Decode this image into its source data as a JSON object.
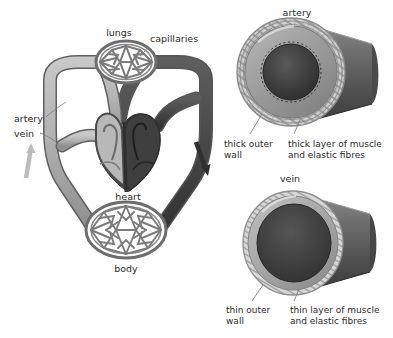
{
  "figure": {
    "background_color": "#ffffff",
    "panels": [
      "circulation-schematic",
      "artery-cross-section",
      "vein-cross-section"
    ]
  },
  "circulation": {
    "labels": {
      "lungs": "lungs",
      "capillaries": "capillaries",
      "artery": "artery",
      "vein": "vein",
      "heart": "heart",
      "body": "body"
    },
    "arrows": {
      "left_arrow_name": "upward-flow-arrow",
      "right_arrow_name": "downward-flow-arrow"
    },
    "colors": {
      "oxygenated_vessel": "#b0b0b0",
      "deoxygenated_vessel": "#4a4a4a",
      "heart_left": "#b8b8b8",
      "heart_right": "#3f3f3f",
      "capillary_net": "#7b7b7b",
      "outline": "#555555"
    }
  },
  "artery_panel": {
    "title": "artery",
    "label_outer_wall": "thick outer\nwall",
    "label_outer_wall_line1": "thick outer",
    "label_outer_wall_line2": "wall",
    "label_muscle_line1": "thick layer of muscle",
    "label_muscle_line2": "and elastic fibres",
    "colors": {
      "outer_texture": "#cfcfcf",
      "muscle_layer": "#9a9a9a",
      "lumen": "#3a3a3a",
      "tube_body": "#6f6f6f"
    }
  },
  "vein_panel": {
    "title": "vein",
    "label_outer_wall_line1": "thin outer",
    "label_outer_wall_line2": "wall",
    "label_muscle_line1": "thin layer of muscle",
    "label_muscle_line2": "and elastic fibres",
    "colors": {
      "outer_texture": "#d4d4d4",
      "muscle_layer": "#a8a8a8",
      "lumen": "#3d3d3d",
      "tube_body": "#6a6a6a"
    }
  }
}
